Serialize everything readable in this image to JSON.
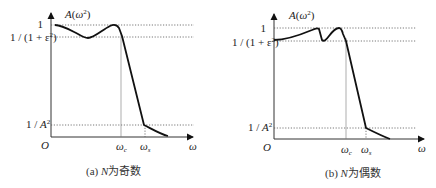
{
  "panels": [
    {
      "id": "a",
      "y_axis_label": "A(ω²)",
      "x_axis_label": "ω",
      "origin_label": "O",
      "y_levels": [
        {
          "label": "1",
          "value": "1"
        },
        {
          "label": "1/(1+ε²)",
          "value": "1/(1+ε²)"
        },
        {
          "label": "1/A²",
          "value": "1/A²"
        }
      ],
      "x_marks": [
        {
          "label": "ω",
          "sub": "c"
        },
        {
          "label": "ω",
          "sub": "s"
        }
      ],
      "caption": "(a) N为奇数",
      "caption_prefix": "(a) ",
      "caption_n": "N",
      "caption_text": "为奇数"
    },
    {
      "id": "b",
      "y_axis_label": "A(ω²)",
      "x_axis_label": "ω",
      "origin_label": "O",
      "y_levels": [
        {
          "label": "1",
          "value": "1"
        },
        {
          "label": "1/(1+ε²)",
          "value": "1/(1+ε²)"
        },
        {
          "label": "1/A²",
          "value": "1/A²"
        }
      ],
      "x_marks": [
        {
          "label": "ω",
          "sub": "c"
        },
        {
          "label": "ω",
          "sub": "s"
        }
      ],
      "caption": "(b) N为偶数",
      "caption_prefix": "(b) ",
      "caption_n": "N",
      "caption_text": "为偶数"
    }
  ],
  "labels": {
    "A": "A",
    "omega": "ω",
    "sq": "2",
    "one": "1",
    "eps_prefix": "1 / (1 + ε",
    "eps_suffix": ")",
    "invA_prefix": "1 / A",
    "open_paren": "(",
    "close_paren": ")"
  }
}
